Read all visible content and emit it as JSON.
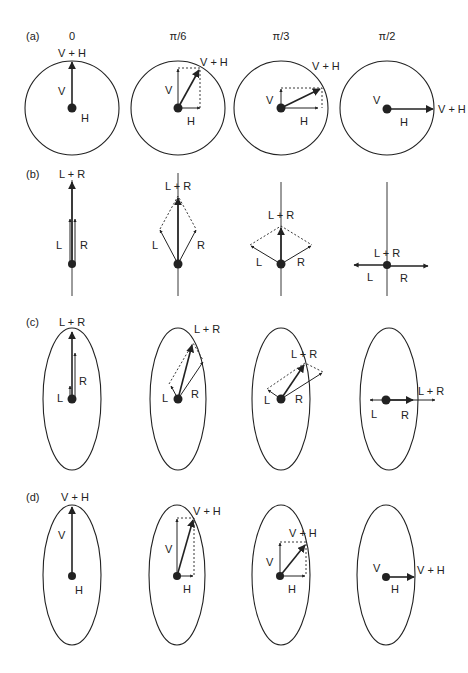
{
  "figure": {
    "columns": [
      {
        "label": "0",
        "x": 72
      },
      {
        "label": "π/6",
        "x": 178
      },
      {
        "label": "π/3",
        "x": 281
      },
      {
        "label": "π/2",
        "x": 387
      }
    ],
    "rows": [
      {
        "id": "a",
        "label": "(a)",
        "shape": "circle",
        "labels": {
          "sum": "V + H",
          "v": "V",
          "h": "H"
        }
      },
      {
        "id": "b",
        "label": "(b)",
        "shape": "line",
        "labels": {
          "sum": "L + R",
          "l": "L",
          "r": "R"
        }
      },
      {
        "id": "c",
        "label": "(c)",
        "shape": "ellipse",
        "labels": {
          "sum": "L + R",
          "l": "L",
          "r": "R"
        }
      },
      {
        "id": "d",
        "label": "(d)",
        "shape": "ellipse",
        "labels": {
          "sum": "V + H",
          "v": "V",
          "h": "H"
        }
      }
    ]
  },
  "colors": {
    "ink": "#222222",
    "background": "#ffffff"
  }
}
